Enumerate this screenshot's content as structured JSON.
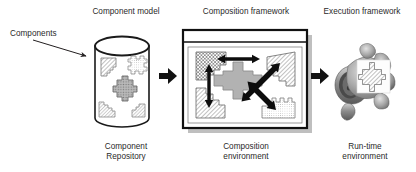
{
  "figure": {
    "background_color": "#ffffff",
    "ink_color": "#231f20"
  },
  "labels": {
    "components": "Components",
    "component_model": "Component model",
    "composition_framework": "Composition framework",
    "execution_framework": "Execution framework",
    "component_repository": "Component\nRepository",
    "composition_environment": "Composition\nenvironment",
    "runtime_environment": "Run-time\nenvironment"
  },
  "stages": [
    {
      "id": "repository",
      "top_label": "Component model",
      "bottom_label": "Component\nRepository",
      "shape": "cylinder",
      "contents": [
        {
          "name": "component-shape-hatched-1",
          "pattern": "diagonal-hatch",
          "fill": "#f0f0f0"
        },
        {
          "name": "component-shape-dotted-1",
          "pattern": "fine-dots",
          "fill": "#e8e8e8"
        },
        {
          "name": "component-shape-center",
          "pattern": "coarse-dots",
          "fill": "#b5b5b5"
        },
        {
          "name": "component-shape-hatched-2",
          "pattern": "diagonal-hatch",
          "fill": "#f0f0f0"
        },
        {
          "name": "component-shape-hatched-3",
          "pattern": "diagonal-hatch",
          "fill": "#f0f0f0"
        }
      ]
    },
    {
      "id": "composition",
      "top_label": "Composition framework",
      "bottom_label": "Composition\nenvironment",
      "shape": "window-box",
      "has_titlebar": true,
      "has_drop_shadow": true,
      "contents": [
        {
          "name": "component-top-left",
          "pattern": "checker-dots",
          "fill": "#ffffff"
        },
        {
          "name": "component-top-right",
          "pattern": "diagonal-hatch",
          "fill": "#ffffff"
        },
        {
          "name": "component-bottom-left",
          "pattern": "diagonal-hatch",
          "fill": "#ffffff"
        },
        {
          "name": "component-bottom-right",
          "pattern": "fine-dots",
          "fill": "#ffffff"
        },
        {
          "name": "component-center-selected",
          "pattern": "solid",
          "fill": "#b0b0b0"
        }
      ],
      "connectors": [
        {
          "name": "arrow-horizontal-top",
          "direction": "bidirectional",
          "orientation": "horizontal"
        },
        {
          "name": "arrow-vertical-left",
          "direction": "bidirectional",
          "orientation": "vertical"
        },
        {
          "name": "arrow-diagonal-upper-right",
          "direction": "bidirectional",
          "orientation": "diagonal"
        },
        {
          "name": "arrow-diagonal-lower-right",
          "direction": "bidirectional",
          "orientation": "diagonal"
        }
      ]
    },
    {
      "id": "runtime",
      "top_label": "Execution framework",
      "bottom_label": "Run-time\nenvironment",
      "shape": "photo",
      "photo_subject": "mechanical engine control unit (grayscale photograph)",
      "overlay": {
        "name": "component-overlay-cross",
        "pattern": "diagonal-hatch"
      }
    }
  ],
  "flow_arrows": [
    {
      "name": "arrow-components-to-repository",
      "style": "thin-line-arrow",
      "from": "Components",
      "to": "Component Repository"
    },
    {
      "name": "arrow-repository-to-composition",
      "style": "solid-block-arrow",
      "from": "Component Repository",
      "to": "Composition environment"
    },
    {
      "name": "arrow-composition-to-runtime",
      "style": "solid-block-arrow",
      "from": "Composition environment",
      "to": "Run-time environment"
    }
  ],
  "colors": {
    "ink": "#231f20",
    "shadow": "#9a9a9a",
    "light_fill": "#f2f2f2",
    "mid_gray": "#b0b0b0",
    "hatch_line": "#8a8a8a"
  }
}
